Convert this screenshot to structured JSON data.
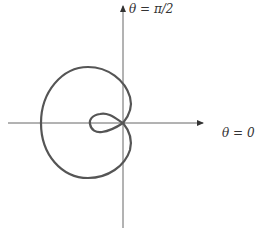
{
  "figure": {
    "type": "polar-curve",
    "labels": {
      "vertical_axis": "θ = π/2",
      "horizontal_axis": "θ = 0"
    },
    "colors": {
      "axes": "#555555",
      "curve": "#555555",
      "background": "#ffffff"
    },
    "origin_px": [
      123,
      123
    ]
  }
}
